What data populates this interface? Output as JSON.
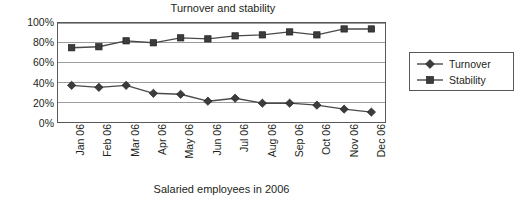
{
  "chart_data": {
    "type": "line",
    "title": "Turnover and stability",
    "xlabel": "Salaried employees in 2006",
    "ylabel": "",
    "categories": [
      "Jan 06",
      "Feb 06",
      "Mar 06",
      "Apr 06",
      "May 06",
      "Jun 06",
      "Jul 06",
      "Aug 06",
      "Sep 06",
      "Oct 06",
      "Nov 06",
      "Dec 06"
    ],
    "series": [
      {
        "name": "Turnover",
        "marker": "diamond",
        "color": "#4a4a4a",
        "values": [
          37,
          35,
          37,
          29,
          28,
          21,
          24,
          19,
          19,
          17,
          13,
          10
        ]
      },
      {
        "name": "Stability",
        "marker": "square",
        "color": "#4a4a4a",
        "values": [
          75,
          76,
          82,
          80,
          85,
          84,
          87,
          88,
          91,
          88,
          94,
          94
        ]
      }
    ],
    "ylim": [
      0,
      100
    ],
    "yticks": [
      0,
      20,
      40,
      60,
      80,
      100
    ],
    "ytick_labels": [
      "0%",
      "20%",
      "40%",
      "60%",
      "80%",
      "100%"
    ],
    "grid": true,
    "grid_axis": "y",
    "legend_position": "right",
    "value_suffix": "%"
  },
  "style": {
    "line_color": "#4a4a4a",
    "marker_color": "#3c3c3c",
    "grid_color": "#9b9b9b",
    "frame_color": "#58585a",
    "background": "#ffffff",
    "text_color": "#231f20"
  },
  "legend": {
    "entries": [
      {
        "label": "Turnover",
        "icon": "diamond-marker-icon"
      },
      {
        "label": "Stability",
        "icon": "square-marker-icon"
      }
    ]
  }
}
